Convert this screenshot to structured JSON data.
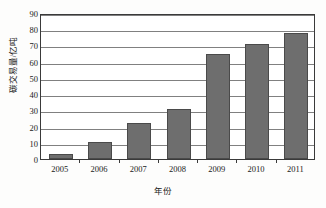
{
  "chart_data": {
    "type": "bar",
    "title": "",
    "xlabel": "年份",
    "ylabel": "碳交易量/亿吨",
    "categories": [
      "2005",
      "2006",
      "2007",
      "2008",
      "2009",
      "2010",
      "2011"
    ],
    "values": [
      3,
      10.5,
      22,
      31,
      65,
      71,
      77.5
    ],
    "ylim": [
      0,
      90
    ],
    "ytick_step": 10,
    "yticks": [
      "90",
      "80",
      "70",
      "60",
      "50",
      "40",
      "30",
      "20",
      "10",
      "0"
    ],
    "grid": "horizontal",
    "legend": "none",
    "series": [
      {
        "name": "碳交易量",
        "values": [
          3,
          10.5,
          22,
          31,
          65,
          71,
          77.5
        ]
      }
    ]
  },
  "style": {
    "bar_color": "#6e6e6e",
    "bar_edge_color": "#4a4a4a",
    "grid_color": "#808080",
    "frame_color": "#3a3a3a",
    "plot_background": "#ffffff",
    "figure_background": "#fdfdfc",
    "text_color": "#1a1a1a"
  }
}
